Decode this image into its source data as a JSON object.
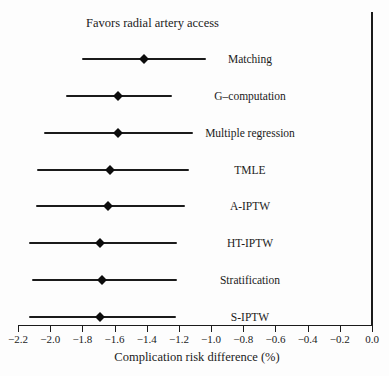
{
  "chart_data": {
    "type": "scatter",
    "subtype": "forest-plot",
    "favors_label": "Favors radial artery access",
    "xlabel": "Complication risk difference (%)",
    "categories": [
      "Matching",
      "G–computation",
      "Multiple regression",
      "TMLE",
      "A-IPTW",
      "HT-IPTW",
      "Stratification",
      "S-IPTW"
    ],
    "series": [
      {
        "name": "estimate",
        "values": [
          -1.42,
          -1.58,
          -1.58,
          -1.63,
          -1.64,
          -1.69,
          -1.68,
          -1.69
        ]
      },
      {
        "name": "ci_low",
        "values": [
          -1.8,
          -1.9,
          -2.04,
          -2.08,
          -2.09,
          -2.13,
          -2.11,
          -2.13
        ]
      },
      {
        "name": "ci_high",
        "values": [
          -1.03,
          -1.24,
          -1.11,
          -1.14,
          -1.16,
          -1.21,
          -1.21,
          -1.22
        ]
      }
    ],
    "xlim": [
      -2.2,
      0.0
    ],
    "xticks": [
      -2.2,
      -2.0,
      -1.8,
      -1.6,
      -1.4,
      -1.2,
      -1.0,
      -0.8,
      -0.6,
      -0.4,
      -0.2,
      0.0
    ],
    "xtick_labels": [
      "−2.2",
      "−2.0",
      "−1.8",
      "−1.6",
      "−1.4",
      "−1.2",
      "−1.0",
      "−0.8",
      "−0.6",
      "−0.4",
      "−0.2",
      "0.0"
    ],
    "reference_line_x": 0.0,
    "grid": false,
    "marker": "diamond",
    "legend": null,
    "colors": {
      "line": "#1b1b1b",
      "marker": "#0c0c0c",
      "text": "#1b1b1b",
      "background": "#fdfdfd"
    }
  }
}
